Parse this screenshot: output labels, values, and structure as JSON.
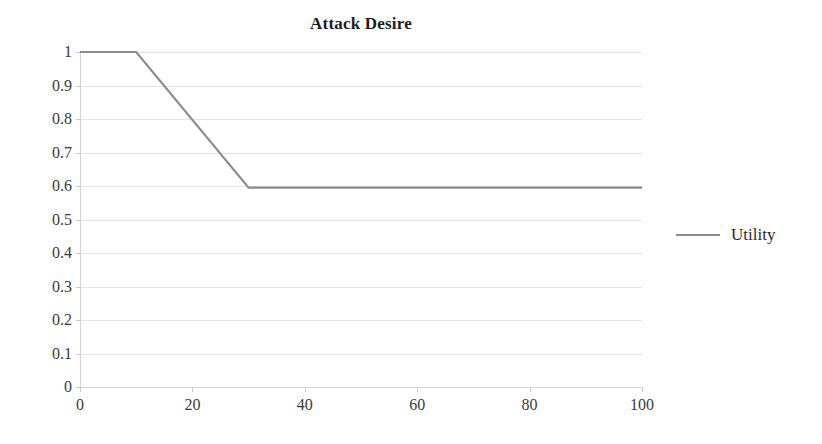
{
  "chart_data": {
    "type": "line",
    "title": "Attack Desire",
    "xlabel": "",
    "ylabel": "",
    "xlim": [
      0,
      100
    ],
    "ylim": [
      0,
      1
    ],
    "grid": "horizontal",
    "legend_position": "right",
    "x_ticks": [
      0,
      20,
      40,
      60,
      80,
      100
    ],
    "x_tick_labels": [
      "0",
      "20",
      "40",
      "60",
      "80",
      "100"
    ],
    "y_ticks": [
      0,
      0.1,
      0.2,
      0.3,
      0.4,
      0.5,
      0.6,
      0.7,
      0.8,
      0.9,
      1
    ],
    "y_tick_labels": [
      "0",
      "0.1",
      "0.2",
      "0.3",
      "0.4",
      "0.5",
      "0.6",
      "0.7",
      "0.8",
      "0.9",
      "1"
    ],
    "series": [
      {
        "name": "Utility",
        "color": "#8c8c8c",
        "x": [
          0,
          10,
          30,
          100
        ],
        "values": [
          1,
          1,
          0.595,
          0.595
        ]
      }
    ]
  },
  "legend": {
    "entries": [
      {
        "label": "Utility",
        "swatch": "line-swatch"
      }
    ]
  },
  "colors": {
    "series_line": "#8c8c8c",
    "gridline": "#e4e4e4",
    "axis_line": "#d5d5d5",
    "tick_mark": "#c9c9c9",
    "title_text": "#1c1c1c",
    "tick_text": "#3a3a3a"
  }
}
